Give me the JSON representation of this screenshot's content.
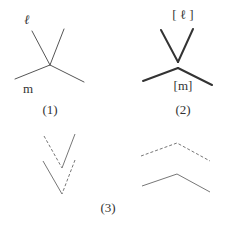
{
  "figures": [
    {
      "id": "1",
      "caption": "(1)",
      "labels": {
        "upper": "ℓ",
        "lower": "m"
      },
      "description": "Four lines meeting at a point (thin)"
    },
    {
      "id": "2",
      "caption": "(2)",
      "labels": {
        "upper": "[ ℓ ]",
        "lower": "[m]"
      },
      "description": "Two V-shaped pairs: upper V (bold) and lower inverted V (bold)"
    },
    {
      "id": "3",
      "caption": "(3)",
      "description": "Left: two stacked V shapes with mixed dashed/solid arms; Right: two stacked inverted-V shapes, upper dashed, lower solid"
    }
  ],
  "colors": {
    "line": "#555555",
    "bold_line": "#333333",
    "dashed_line": "#777777",
    "text": "#333333"
  }
}
